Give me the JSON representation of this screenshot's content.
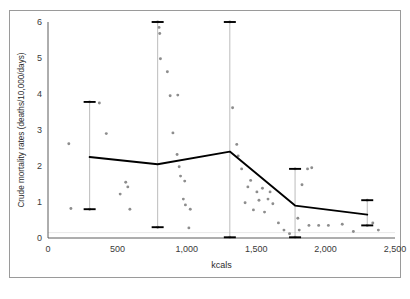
{
  "figure": {
    "border_color": "#9a9a9a",
    "background": "#ffffff"
  },
  "axis_labels": {
    "x_title": "kcals",
    "y_title": "Crude mortality rates (deaths/10,000/days)",
    "x_ticks": [
      "0",
      "500",
      "1,000",
      "1,500",
      "2,000",
      "2,500"
    ],
    "y_ticks": [
      "0",
      "1",
      "2",
      "3",
      "4",
      "5",
      "6"
    ]
  },
  "chart_data": {
    "type": "scatter",
    "title": "",
    "subtitle": "",
    "xlabel": "kcals",
    "ylabel": "Crude mortality rates (deaths/10,000/days)",
    "xlim": [
      0,
      2500
    ],
    "ylim": [
      0,
      6
    ],
    "xticks": [
      0,
      500,
      1000,
      1500,
      2000,
      2500
    ],
    "yticks": [
      0,
      1,
      2,
      3,
      4,
      5,
      6
    ],
    "grid": false,
    "legend": "none",
    "colors": {
      "scatter_point": "#8d8d8d",
      "mean_line": "#000000",
      "error_bar_cap": "#000000",
      "error_bar_spine": "#b4b4b4",
      "axis": "#4a4a4a",
      "gridline": "#e2e2e2"
    },
    "series": [
      {
        "name": "Observations",
        "type": "scatter",
        "points": [
          [
            150,
            2.62
          ],
          [
            165,
            0.82
          ],
          [
            300,
            3.78
          ],
          [
            300,
            0.8
          ],
          [
            370,
            3.75
          ],
          [
            420,
            2.9
          ],
          [
            520,
            1.22
          ],
          [
            560,
            1.55
          ],
          [
            575,
            1.42
          ],
          [
            590,
            0.8
          ],
          [
            790,
            6.0
          ],
          [
            790,
            0.3
          ],
          [
            800,
            5.85
          ],
          [
            805,
            5.68
          ],
          [
            810,
            4.98
          ],
          [
            860,
            4.62
          ],
          [
            880,
            3.95
          ],
          [
            935,
            3.97
          ],
          [
            900,
            2.92
          ],
          [
            930,
            2.32
          ],
          [
            945,
            1.98
          ],
          [
            955,
            1.72
          ],
          [
            985,
            1.58
          ],
          [
            975,
            1.08
          ],
          [
            990,
            0.92
          ],
          [
            1025,
            0.8
          ],
          [
            1015,
            0.28
          ],
          [
            1310,
            6.0
          ],
          [
            1310,
            0.02
          ],
          [
            1330,
            3.62
          ],
          [
            1360,
            2.6
          ],
          [
            1370,
            2.28
          ],
          [
            1395,
            1.92
          ],
          [
            1420,
            0.98
          ],
          [
            1440,
            1.42
          ],
          [
            1460,
            1.6
          ],
          [
            1480,
            0.78
          ],
          [
            1505,
            1.28
          ],
          [
            1520,
            1.05
          ],
          [
            1545,
            1.38
          ],
          [
            1560,
            0.72
          ],
          [
            1585,
            1.08
          ],
          [
            1600,
            1.28
          ],
          [
            1620,
            0.95
          ],
          [
            1660,
            0.42
          ],
          [
            1700,
            0.22
          ],
          [
            1740,
            0.12
          ],
          [
            1780,
            1.92
          ],
          [
            1780,
            0.02
          ],
          [
            1800,
            0.55
          ],
          [
            1810,
            0.22
          ],
          [
            1830,
            1.48
          ],
          [
            1870,
            1.92
          ],
          [
            1900,
            1.95
          ],
          [
            1880,
            0.35
          ],
          [
            1950,
            0.35
          ],
          [
            2020,
            0.35
          ],
          [
            2120,
            0.38
          ],
          [
            2200,
            0.18
          ],
          [
            2300,
            1.05
          ],
          [
            2300,
            0.35
          ],
          [
            2340,
            0.42
          ],
          [
            2380,
            0.22
          ]
        ]
      },
      {
        "name": "Mean with 95% interval",
        "type": "line_with_error_bars",
        "x": [
          300,
          790,
          1310,
          1780,
          2300
        ],
        "mean": [
          2.25,
          2.05,
          2.4,
          0.9,
          0.65
        ],
        "lower": [
          0.8,
          0.3,
          0.02,
          0.02,
          0.35
        ],
        "upper": [
          3.78,
          6.0,
          6.0,
          1.92,
          1.05
        ]
      }
    ]
  }
}
